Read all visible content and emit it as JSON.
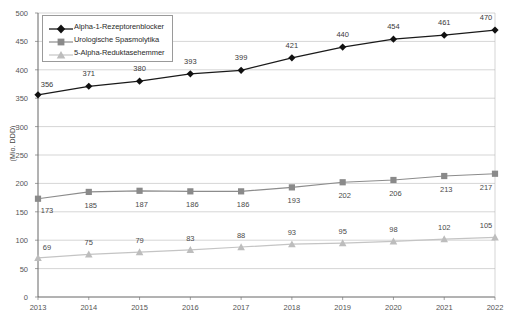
{
  "chart_data": {
    "type": "line",
    "title": "",
    "xlabel": "",
    "ylabel": "(Mio. DDD)",
    "categories": [
      "2013",
      "2014",
      "2015",
      "2016",
      "2017",
      "2018",
      "2019",
      "2020",
      "2021",
      "2022"
    ],
    "ylim": [
      0,
      500
    ],
    "yticks": [
      "0",
      "50",
      "100",
      "150",
      "200",
      "250",
      "300",
      "350",
      "400",
      "450",
      "500"
    ],
    "grid": true,
    "legend_position": "top-left",
    "series": [
      {
        "name": "Alpha-1-Rezeptorenblocker",
        "marker": "diamond",
        "color": "#111111",
        "values": [
          356,
          371,
          380,
          393,
          399,
          421,
          440,
          454,
          461,
          470
        ]
      },
      {
        "name": "Urologische Spasmolytika",
        "marker": "square",
        "color": "#8a8a8a",
        "values": [
          173,
          185,
          187,
          186,
          186,
          193,
          202,
          206,
          213,
          217
        ]
      },
      {
        "name": "5-Alpha-Reduktasehemmer",
        "marker": "triangle",
        "color": "#bdbdbd",
        "values": [
          69,
          75,
          79,
          83,
          88,
          93,
          95,
          98,
          102,
          105
        ]
      }
    ]
  }
}
